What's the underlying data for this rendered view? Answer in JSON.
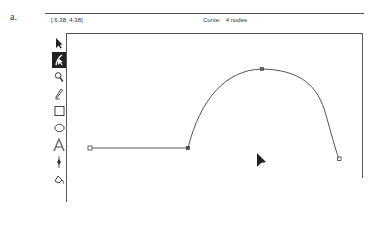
{
  "figure": {
    "label": "a."
  },
  "status_bar": {
    "coordinates": "[ 6.38, 4.38]",
    "object_info": "Curve:   4 nodes"
  },
  "toolbar": {
    "tools": [
      {
        "name": "pick-tool",
        "selected": false
      },
      {
        "name": "shape-tool",
        "selected": true
      },
      {
        "name": "zoom-tool",
        "selected": false
      },
      {
        "name": "pencil-tool",
        "selected": false
      },
      {
        "name": "rectangle-tool",
        "selected": false
      },
      {
        "name": "ellipse-tool",
        "selected": false
      },
      {
        "name": "text-tool",
        "selected": false
      },
      {
        "name": "outline-pen-tool",
        "selected": false
      },
      {
        "name": "fill-tool",
        "selected": false
      }
    ]
  },
  "canvas": {
    "curve": {
      "node_count": 4,
      "nodes": [
        {
          "x": 90,
          "y": 148,
          "type": "start",
          "selected": false
        },
        {
          "x": 188,
          "y": 148,
          "type": "cusp",
          "selected": true
        },
        {
          "x": 262,
          "y": 69,
          "type": "smooth",
          "selected": true
        },
        {
          "x": 339,
          "y": 159,
          "type": "end",
          "selected": false
        }
      ]
    },
    "pointer": {
      "x": 258,
      "y": 156
    }
  },
  "colors": {
    "line": "#555555",
    "toolbar_selected_bg": "#222222",
    "background": "#ffffff"
  }
}
